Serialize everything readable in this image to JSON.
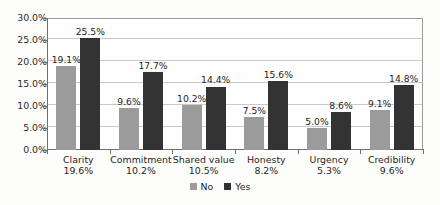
{
  "chart_data": {
    "type": "bar",
    "title": "",
    "subtitle": "",
    "xlabel": "",
    "ylabel": "",
    "ylim": [
      0,
      30
    ],
    "ytick_values": [
      0,
      5,
      10,
      15,
      20,
      25,
      30
    ],
    "ytick_labels": [
      "0.0%",
      "5.0%",
      "10.0%",
      "15.0%",
      "20.0%",
      "25.0%",
      "30.0%"
    ],
    "grid": true,
    "legend_position": "bottom-center",
    "categories": [
      "Clarity",
      "Commitment",
      "Shared value",
      "Honesty",
      "Urgency",
      "Credibility"
    ],
    "category_totals": [
      "19.6%",
      "10.2%",
      "10.5%",
      "8.2%",
      "5.3%",
      "9.6%"
    ],
    "series": [
      {
        "name": "No",
        "color": "#9b9b9b",
        "values": [
          19.1,
          9.6,
          10.2,
          7.5,
          5.0,
          9.1
        ],
        "labels": [
          "19.1%",
          "9.6%",
          "10.2%",
          "7.5%",
          "5.0%",
          "9.1%"
        ]
      },
      {
        "name": "Yes",
        "color": "#333333",
        "values": [
          25.5,
          17.7,
          14.4,
          15.6,
          8.6,
          14.8
        ],
        "labels": [
          "25.5%",
          "17.7%",
          "14.4%",
          "15.6%",
          "8.6%",
          "14.8%"
        ]
      }
    ]
  },
  "legend": {
    "items": [
      {
        "label": "No",
        "swatch": "no"
      },
      {
        "label": "Yes",
        "swatch": "yes"
      }
    ]
  }
}
